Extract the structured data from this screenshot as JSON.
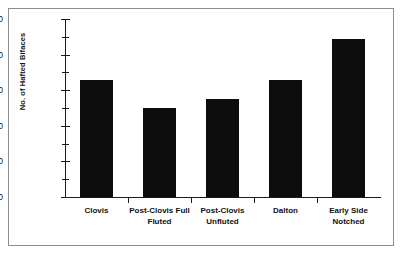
{
  "chart_data": {
    "type": "bar",
    "title": "",
    "subtitle": "",
    "xlabel": "",
    "ylabel": "No. of Hafted Bifaces",
    "categories": [
      "Clovis",
      "Post-Clovis Full Fluted",
      "Post-Clovis Unfluted",
      "Dalton",
      "Early Side Notched"
    ],
    "values": [
      3.3,
      2.5,
      2.75,
      3.3,
      4.45
    ],
    "ylim": [
      0,
      5
    ],
    "ytick_labels": [
      "0.00",
      "1.00",
      "2.00",
      "3.00",
      "4.00",
      "5.00"
    ],
    "ytick_values": [
      0,
      1,
      2,
      3,
      4,
      5
    ],
    "yminor_interval": 0.5,
    "grid": false,
    "legend": null,
    "bar_color": "#0d0d0d",
    "axis_color": "#1a1a1a",
    "background": "#ffffff",
    "border_color": "#8e8e8e"
  }
}
